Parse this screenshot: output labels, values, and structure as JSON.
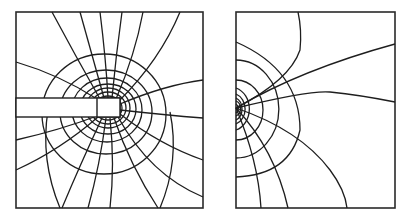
{
  "figure": {
    "stroke_color": "#1e1e1e",
    "background": "#ffffff"
  },
  "panels": [
    {
      "name": "left-panel",
      "frame": {
        "x": 16,
        "y": 12,
        "w": 187,
        "h": 196
      },
      "conductor_bar": {
        "x": 16,
        "y": 98,
        "w": 104,
        "h": 19
      },
      "conductor_tip": {
        "x": 97,
        "y": 98,
        "w": 23,
        "h": 19
      },
      "center": {
        "x": 108,
        "y": 108
      },
      "equipotential_radii": [
        [
          11,
          10
        ],
        [
          15,
          14
        ],
        [
          20,
          18
        ],
        [
          26,
          24
        ],
        [
          33,
          30
        ],
        [
          45,
          42
        ],
        [
          60,
          58
        ],
        [
          79,
          80
        ]
      ],
      "flux_angles_deg": [
        -90,
        -70,
        -50,
        -30,
        -12,
        0,
        12,
        30,
        50,
        70,
        90,
        110,
        130,
        150,
        200,
        220,
        250,
        270,
        290
      ]
    },
    {
      "name": "right-panel",
      "frame": {
        "x": 236,
        "y": 12,
        "w": 159,
        "h": 196
      },
      "center": {
        "x": 238,
        "y": 108
      },
      "equipotential_radii": [
        [
          4,
          5
        ],
        [
          7,
          8
        ],
        [
          10,
          12
        ],
        [
          14,
          16
        ],
        [
          19,
          22
        ],
        [
          26,
          30
        ],
        [
          40,
          46
        ],
        [
          56,
          70
        ]
      ],
      "flux_angles_deg": [
        -75,
        -55,
        -35,
        -10,
        15,
        35,
        55,
        75
      ]
    }
  ]
}
